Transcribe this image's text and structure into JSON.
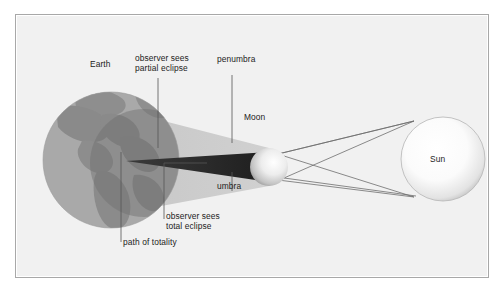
{
  "figure": {
    "type": "solar-eclipse-geometry-diagram",
    "background_color": "#f1f1f1",
    "frame_border_color": "#a8a8a8"
  },
  "labels": {
    "earth": "Earth",
    "observer_partial": "observer sees\npartial eclipse",
    "penumbra": "penumbra",
    "moon": "Moon",
    "sun": "Sun",
    "umbra": "umbra",
    "observer_total": "observer sees\ntotal eclipse",
    "path_of_totality": "path of totality"
  },
  "bodies": {
    "earth": {
      "name": "Earth",
      "cx": 95,
      "cy": 145,
      "r": 68,
      "ocean_color": "#a6a6a6",
      "land_color": "#8c8c8c",
      "night_color": "#7a7a7a"
    },
    "moon": {
      "name": "Moon",
      "cx": 253,
      "cy": 152,
      "r": 19,
      "light_color": "#f2f2f2",
      "shade_color": "#9a9a9a"
    },
    "sun": {
      "name": "Sun",
      "cx": 427,
      "cy": 144,
      "r": 42,
      "light_color": "#ffffff",
      "edge_color": "#b9b9b9"
    }
  },
  "shadows": {
    "penumbra": {
      "name": "penumbra",
      "color": "#c9c9c9",
      "shape": "expanding-cone-toward-earth"
    },
    "umbra": {
      "name": "umbra",
      "color": "#2e2e2e",
      "shape": "converging-cone-tip-on-earth"
    },
    "night_side": {
      "name": "earth-night-side",
      "color": "#6f6f6f"
    }
  },
  "rays": {
    "color": "#6d6d6d",
    "count": 4,
    "description": "tangent light rays from sun limbs crossing past the moon",
    "arrowheads": 4
  },
  "leaders": {
    "color": "#555555",
    "items": [
      {
        "name": "leader-observer-partial",
        "from_label": "observer sees partial eclipse"
      },
      {
        "name": "leader-penumbra",
        "from_label": "penumbra"
      },
      {
        "name": "leader-umbra",
        "from_label": "umbra"
      },
      {
        "name": "leader-observer-total",
        "from_label": "observer sees total eclipse"
      },
      {
        "name": "leader-path-of-totality",
        "from_label": "path of totality"
      }
    ]
  }
}
